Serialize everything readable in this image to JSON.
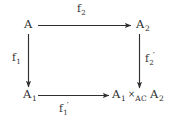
{
  "diagram": {
    "type": "commutative-square",
    "background_color": "#ffffff",
    "ink_color": "#303030",
    "nodes": [
      {
        "id": "top-left",
        "base": "A",
        "subscript": "",
        "label_plain": "A"
      },
      {
        "id": "top-right",
        "base": "A",
        "subscript": "2",
        "label_plain": "A_2"
      },
      {
        "id": "bottom-left",
        "base": "A",
        "subscript": "1",
        "label_plain": "A_1"
      },
      {
        "id": "bottom-right",
        "left_base": "A",
        "left_subscript": "1",
        "operator": "×",
        "operator_subscript": "AC",
        "right_base": "A",
        "right_subscript": "2",
        "label_plain": "A_1 ×_AC A_2"
      }
    ],
    "arrows": [
      {
        "id": "top",
        "from": "top-left",
        "to": "top-right",
        "direction": "right",
        "label_base": "f",
        "label_subscript": "2",
        "label_prime": "",
        "label_plain": "f_2"
      },
      {
        "id": "left",
        "from": "top-left",
        "to": "bottom-left",
        "direction": "down",
        "label_base": "f",
        "label_subscript": "1",
        "label_prime": "",
        "label_plain": "f_1"
      },
      {
        "id": "right",
        "from": "top-right",
        "to": "bottom-right",
        "direction": "down",
        "label_base": "f",
        "label_subscript": "2",
        "label_prime": "′",
        "label_plain": "f_2'"
      },
      {
        "id": "bottom",
        "from": "bottom-left",
        "to": "bottom-right",
        "direction": "right",
        "label_base": "f",
        "label_subscript": "1",
        "label_prime": "′",
        "label_plain": "f_1'"
      }
    ]
  }
}
